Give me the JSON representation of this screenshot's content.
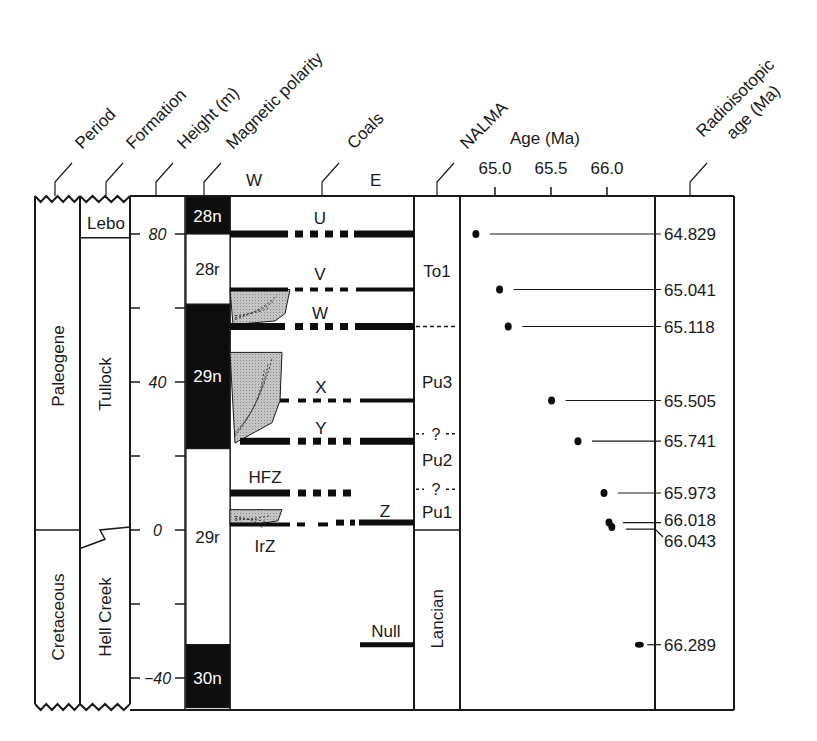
{
  "headers": {
    "period": "Period",
    "formation": "Formation",
    "height": "Height (m)",
    "magnetic_polarity": "Magnetic polarity",
    "coals": "Coals",
    "nalma": "NALMA",
    "age": "Age (Ma)",
    "radioisotopic_line1": "Radioisotopic",
    "radioisotopic_line2": "age (Ma)"
  },
  "coal_directions": {
    "west": "W",
    "east": "E"
  },
  "periods": [
    {
      "name": "Paleogene",
      "from_m": 0,
      "to_m": 90
    },
    {
      "name": "Cretaceous",
      "from_m": -48,
      "to_m": 0
    }
  ],
  "formations": [
    {
      "name": "Lebo",
      "from_m": 79,
      "to_m": 90
    },
    {
      "name": "Tullock",
      "from_m": 0,
      "to_m": 79
    },
    {
      "name": "Hell Creek",
      "from_m": -48,
      "to_m": 0
    }
  ],
  "height_axis": {
    "ticks": [
      {
        "value": 80,
        "label": "80"
      },
      {
        "value": 60,
        "label": ""
      },
      {
        "value": 40,
        "label": "40"
      },
      {
        "value": 20,
        "label": ""
      },
      {
        "value": 0,
        "label": "0"
      },
      {
        "value": -20,
        "label": ""
      },
      {
        "value": -40,
        "label": "−40"
      }
    ]
  },
  "polarity_chrons": [
    {
      "name": "28n",
      "from_m": 80,
      "to_m": 90,
      "normal": true
    },
    {
      "name": "28r",
      "from_m": 61,
      "to_m": 80,
      "normal": false
    },
    {
      "name": "29n",
      "from_m": 22,
      "to_m": 61,
      "normal": true
    },
    {
      "name": "29r",
      "from_m": -31,
      "to_m": 22,
      "normal": false
    },
    {
      "name": "30n",
      "from_m": -48,
      "to_m": -31,
      "normal": true
    }
  ],
  "coals": [
    {
      "name": "U",
      "height_m": 80
    },
    {
      "name": "V",
      "height_m": 65
    },
    {
      "name": "W",
      "height_m": 55
    },
    {
      "name": "X",
      "height_m": 35
    },
    {
      "name": "Y",
      "height_m": 24
    },
    {
      "name": "HFZ",
      "height_m": 10
    },
    {
      "name": "Z",
      "height_m": 2
    },
    {
      "name": "IrZ",
      "height_m": 0
    },
    {
      "name": "Null",
      "height_m": -31
    }
  ],
  "nalma": [
    {
      "name": "To1",
      "from_m": 55,
      "to_m": 90
    },
    {
      "name": "Pu3",
      "from_m": 26,
      "to_m": 55
    },
    {
      "name": "?",
      "boundary": true,
      "height_m": 26
    },
    {
      "name": "Pu2",
      "from_m": 11,
      "to_m": 26
    },
    {
      "name": "?",
      "boundary": true,
      "height_m": 11
    },
    {
      "name": "Pu1",
      "from_m": 0,
      "to_m": 11
    },
    {
      "name": "Lancian",
      "from_m": -48,
      "to_m": 0
    }
  ],
  "chart_data": {
    "type": "scatter",
    "title": "Age (Ma)",
    "xlabel": "Age (Ma)",
    "ylabel": "Height (m)",
    "xticks": [
      "65.0",
      "65.5",
      "66.0"
    ],
    "xlim": [
      64.55,
      66.7
    ],
    "ylim": [
      -48,
      90
    ],
    "points": [
      {
        "age": 64.829,
        "height_m": 80,
        "label": "64.829"
      },
      {
        "age": 65.041,
        "height_m": 65,
        "label": "65.041"
      },
      {
        "age": 65.118,
        "height_m": 55,
        "label": "65.118"
      },
      {
        "age": 65.505,
        "height_m": 35,
        "label": "65.505"
      },
      {
        "age": 65.741,
        "height_m": 24,
        "label": "65.741"
      },
      {
        "age": 65.973,
        "height_m": 10,
        "label": "65.973"
      },
      {
        "age": 66.018,
        "height_m": 2,
        "label": "66.018"
      },
      {
        "age": 66.043,
        "height_m": 0.8,
        "label": "66.043"
      },
      {
        "age": 66.289,
        "height_m": -31,
        "label": "66.289"
      }
    ]
  }
}
